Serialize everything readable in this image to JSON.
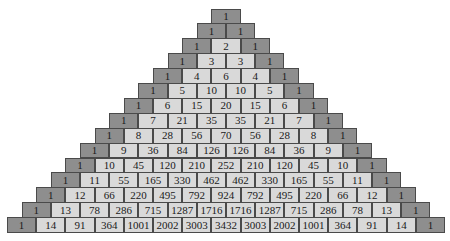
{
  "colors": {
    "edge": "#8e8e8e",
    "interior": "#d9d9d9",
    "border": "#4a4a4a"
  },
  "rows": [
    [
      1
    ],
    [
      1,
      1
    ],
    [
      1,
      2,
      1
    ],
    [
      1,
      3,
      3,
      1
    ],
    [
      1,
      4,
      6,
      4,
      1
    ],
    [
      1,
      5,
      10,
      10,
      5,
      1
    ],
    [
      1,
      6,
      15,
      20,
      15,
      6,
      1
    ],
    [
      1,
      7,
      21,
      35,
      35,
      21,
      7,
      1
    ],
    [
      1,
      8,
      28,
      56,
      70,
      56,
      28,
      8,
      1
    ],
    [
      1,
      9,
      36,
      84,
      126,
      126,
      84,
      36,
      9,
      1
    ],
    [
      1,
      10,
      45,
      120,
      210,
      252,
      210,
      120,
      45,
      10,
      1
    ],
    [
      1,
      11,
      55,
      165,
      330,
      462,
      462,
      330,
      165,
      55,
      11,
      1
    ],
    [
      1,
      12,
      66,
      220,
      495,
      792,
      924,
      792,
      495,
      220,
      66,
      12,
      1
    ],
    [
      1,
      13,
      78,
      286,
      715,
      1287,
      1716,
      1716,
      1287,
      715,
      286,
      78,
      13,
      1
    ],
    [
      1,
      14,
      91,
      364,
      1001,
      2002,
      3003,
      3432,
      3003,
      2002,
      1001,
      364,
      91,
      14,
      1
    ]
  ]
}
